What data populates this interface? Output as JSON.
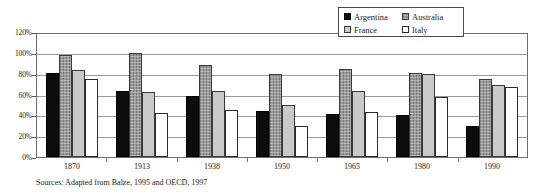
{
  "chart_data": {
    "type": "bar",
    "title": "",
    "xlabel": "",
    "ylabel": "",
    "categories": [
      "1870",
      "1913",
      "1938",
      "1950",
      "1965",
      "1980",
      "1990"
    ],
    "series": [
      {
        "name": "Argentina",
        "color": "#0d0d0d",
        "values": [
          82,
          64,
          60,
          45,
          42,
          41,
          30
        ]
      },
      {
        "name": "Australia",
        "color": "#9b9b9b",
        "values": [
          100,
          101,
          90,
          81,
          86,
          82,
          76
        ]
      },
      {
        "name": "France",
        "color": "#c9c9c9",
        "values": [
          85,
          63,
          64,
          51,
          64,
          81,
          70
        ]
      },
      {
        "name": "Italy",
        "color": "#ffffff",
        "values": [
          76,
          43,
          46,
          30,
          44,
          59,
          68
        ]
      }
    ],
    "ylim": [
      0,
      120
    ],
    "yticks": [
      "0%",
      "20%",
      "40%",
      "60%",
      "80%",
      "100%",
      "120%"
    ],
    "ytick_values": [
      0,
      20,
      40,
      60,
      80,
      100,
      120
    ],
    "grid": true,
    "legend_position": "top-right"
  },
  "legend": {
    "entries": [
      {
        "label": "Argentina",
        "key": "argentina"
      },
      {
        "label": "Australia",
        "key": "australia"
      },
      {
        "label": "France",
        "key": "france"
      },
      {
        "label": "Italy",
        "key": "italy"
      }
    ]
  },
  "source_note": "Sources:  Adapted from Balze, 1995 and OECD, 1997"
}
